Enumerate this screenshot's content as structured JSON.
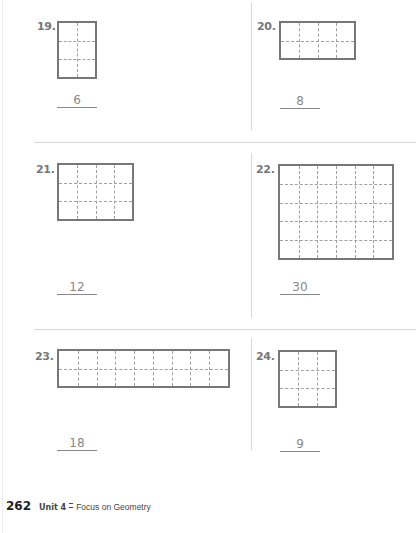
{
  "problems": [
    {
      "number": "19.",
      "cols": 2,
      "rows": 3,
      "answer": "6",
      "num_pos": [
        37,
        20
      ],
      "grid": [
        57,
        21,
        40,
        58
      ],
      "line": [
        57,
        107,
        40
      ],
      "ans_pos": [
        57,
        93
      ]
    },
    {
      "number": "20.",
      "cols": 4,
      "rows": 2,
      "answer": "8",
      "num_pos": [
        257,
        20
      ],
      "grid": [
        279,
        21,
        77,
        39
      ],
      "line": [
        280,
        108,
        40
      ],
      "ans_pos": [
        280,
        94
      ]
    },
    {
      "number": "21.",
      "cols": 4,
      "rows": 3,
      "answer": "12",
      "num_pos": [
        36,
        163
      ],
      "grid": [
        57,
        163,
        77,
        58
      ],
      "line": [
        57,
        294,
        40
      ],
      "ans_pos": [
        57,
        280
      ]
    },
    {
      "number": "22.",
      "cols": 6,
      "rows": 5,
      "answer": "30",
      "num_pos": [
        256,
        163
      ],
      "grid": [
        278,
        164,
        116,
        96
      ],
      "line": [
        280,
        294,
        40
      ],
      "ans_pos": [
        280,
        280
      ]
    },
    {
      "number": "23.",
      "cols": 9,
      "rows": 2,
      "answer": "18",
      "num_pos": [
        35,
        350
      ],
      "grid": [
        57,
        349,
        173,
        39
      ],
      "line": [
        57,
        450,
        40
      ],
      "ans_pos": [
        57,
        436
      ]
    },
    {
      "number": "24.",
      "cols": 3,
      "rows": 3,
      "answer": "9",
      "num_pos": [
        256,
        350
      ],
      "grid": [
        278,
        350,
        59,
        58
      ],
      "line": [
        280,
        451,
        40
      ],
      "ans_pos": [
        280,
        437
      ]
    }
  ],
  "footer": {
    "page_number": "262",
    "unit": "Unit 4",
    "title": "Focus on Geometry"
  }
}
